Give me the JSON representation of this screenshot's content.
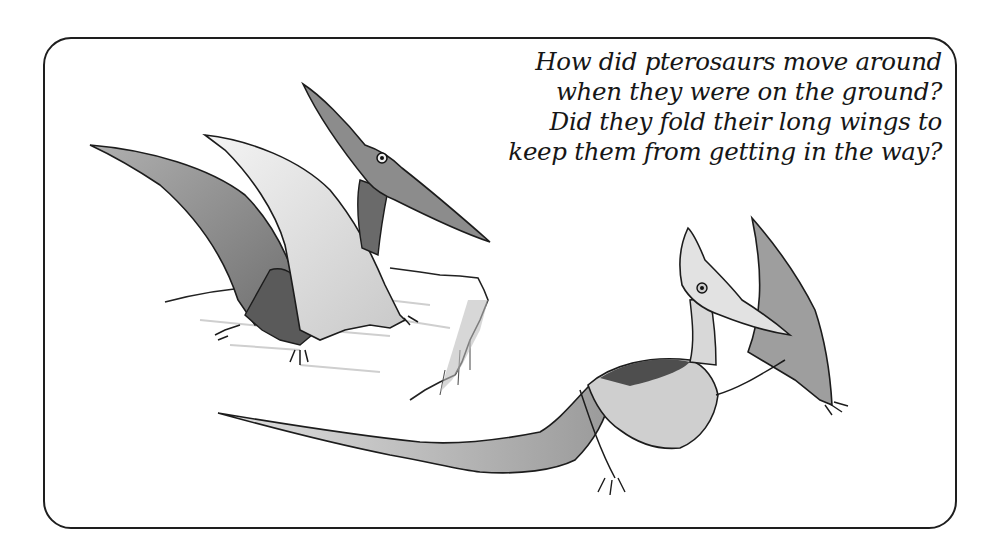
{
  "page": {
    "caption_lines": [
      "How did pterosaurs move around",
      "when they were on the ground?",
      "Did they fold their long wings to",
      "keep them from getting in the way?"
    ],
    "illustrations": [
      {
        "name": "pterosaur-perched-on-rock",
        "description": "Pterosaur standing on a rocky ledge with wings raised"
      },
      {
        "name": "pterosaur-crawling",
        "description": "Pterosaur walking on all fours with wings spread low"
      }
    ],
    "colors": {
      "border": "#1e1e1e",
      "ink": "#161616",
      "wing_dark": "#8a8a8a",
      "wing_light": "#e6e6e6",
      "background": "#ffffff"
    }
  }
}
